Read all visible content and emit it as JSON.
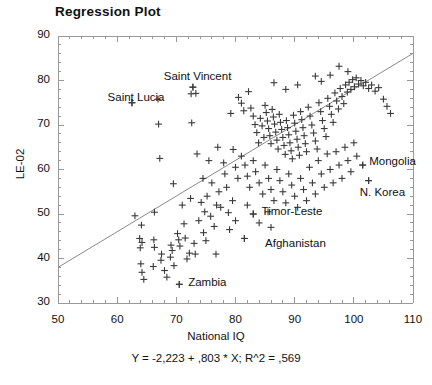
{
  "chart_data": {
    "type": "scatter",
    "title": "Regression Plot",
    "xlabel": "National IQ",
    "ylabel": "LE-02",
    "xlim": [
      50,
      110
    ],
    "ylim": [
      30,
      90
    ],
    "xticks": [
      "50",
      "60",
      "70",
      "80",
      "90",
      "100",
      "110"
    ],
    "yticks": [
      "90",
      "80",
      "70",
      "60",
      "50",
      "40",
      "30"
    ],
    "xtick_values": [
      50,
      60,
      70,
      80,
      90,
      100,
      110
    ],
    "ytick_values": [
      90,
      80,
      70,
      60,
      50,
      40,
      30
    ],
    "grid": false,
    "legend": "none",
    "equation": "Y = -2,223 + ,803 * X; R^2 = ,569",
    "regression": {
      "intercept": -2.223,
      "slope": 0.803,
      "r_squared": 0.569,
      "x_start": 50,
      "y_start": 38.0,
      "x_end": 110,
      "y_end": 86.1
    },
    "marker": "plus",
    "marker_color": "#3a3a3a",
    "line_color": "#8a8a8a",
    "axis_color": "#999999",
    "annotations": [
      {
        "label": "Saint Lucia",
        "x": 62.5,
        "y": 75.0,
        "text_x": 68.0,
        "text_y": 75.8,
        "anchor": "end"
      },
      {
        "label": "Saint Vincent",
        "x": 72.8,
        "y": 78.5,
        "text_x": 79.3,
        "text_y": 80.6,
        "anchor": "end"
      },
      {
        "label": "Mongolia",
        "x": 101.5,
        "y": 61.0,
        "text_x": 102.6,
        "text_y": 61.4,
        "anchor": "start"
      },
      {
        "label": "N. Korea",
        "x": 102.5,
        "y": 57.5,
        "text_x": 101.0,
        "text_y": 54.6,
        "anchor": "start"
      },
      {
        "label": "Timor-Leste",
        "x": 83.0,
        "y": 50.0,
        "text_x": 84.4,
        "text_y": 50.3,
        "anchor": "start"
      },
      {
        "label": "Afghanistan",
        "x": 81.5,
        "y": 44.5,
        "text_x": 85.0,
        "text_y": 43.0,
        "anchor": "start"
      },
      {
        "label": "Zambia",
        "x": 70.5,
        "y": 34.2,
        "text_x": 72.0,
        "text_y": 34.2,
        "anchor": "start"
      }
    ],
    "points": [
      [
        62.5,
        75.0
      ],
      [
        66.9,
        75.8
      ],
      [
        67.0,
        70.2
      ],
      [
        67.2,
        62.5
      ],
      [
        72.8,
        78.5
      ],
      [
        72.5,
        77.0
      ],
      [
        73.3,
        77.1
      ],
      [
        72.6,
        70.5
      ],
      [
        69.5,
        56.8
      ],
      [
        63.0,
        49.6
      ],
      [
        66.3,
        50.4
      ],
      [
        64.1,
        47.5
      ],
      [
        63.8,
        44.5
      ],
      [
        64.2,
        43.6
      ],
      [
        63.9,
        42.4
      ],
      [
        64.0,
        38.8
      ],
      [
        64.2,
        36.9
      ],
      [
        64.5,
        35.3
      ],
      [
        66.2,
        44.2
      ],
      [
        66.3,
        42.5
      ],
      [
        66.1,
        38.2
      ],
      [
        67.5,
        41.0
      ],
      [
        67.4,
        39.6
      ],
      [
        68.0,
        37.3
      ],
      [
        68.4,
        35.8
      ],
      [
        69.1,
        43.0
      ],
      [
        69.3,
        41.8
      ],
      [
        69.0,
        40.3
      ],
      [
        69.6,
        38.4
      ],
      [
        70.2,
        45.6
      ],
      [
        70.4,
        44.2
      ],
      [
        70.6,
        42.8
      ],
      [
        70.5,
        34.2
      ],
      [
        71.3,
        47.8
      ],
      [
        71.5,
        44.6
      ],
      [
        71.8,
        39.9
      ],
      [
        72.2,
        41.2
      ],
      [
        73.0,
        43.4
      ],
      [
        73.2,
        41.0
      ],
      [
        74.2,
        52.6
      ],
      [
        74.6,
        45.8
      ],
      [
        75.0,
        44.0
      ],
      [
        76.4,
        47.2
      ],
      [
        76.7,
        41.0
      ],
      [
        78.8,
        50.3
      ],
      [
        79.2,
        72.6
      ],
      [
        80.5,
        76.2
      ],
      [
        81.0,
        74.9
      ],
      [
        81.4,
        73.2
      ],
      [
        82.2,
        77.5
      ],
      [
        82.6,
        73.8
      ],
      [
        83.0,
        72.0
      ],
      [
        83.3,
        70.1
      ],
      [
        83.6,
        68.3
      ],
      [
        83.9,
        66.0
      ],
      [
        84.2,
        71.5
      ],
      [
        84.5,
        69.8
      ],
      [
        84.8,
        67.2
      ],
      [
        85.0,
        74.4
      ],
      [
        85.2,
        72.8
      ],
      [
        85.4,
        70.9
      ],
      [
        85.6,
        69.2
      ],
      [
        85.8,
        67.6
      ],
      [
        86.0,
        65.8
      ],
      [
        86.2,
        73.5
      ],
      [
        86.4,
        71.8
      ],
      [
        86.6,
        70.2
      ],
      [
        86.8,
        68.4
      ],
      [
        87.0,
        66.6
      ],
      [
        87.2,
        64.6
      ],
      [
        87.4,
        72.4
      ],
      [
        87.6,
        70.6
      ],
      [
        87.8,
        69.0
      ],
      [
        88.0,
        67.2
      ],
      [
        88.2,
        65.4
      ],
      [
        88.4,
        63.4
      ],
      [
        88.6,
        71.0
      ],
      [
        88.8,
        69.4
      ],
      [
        89.0,
        67.8
      ],
      [
        89.2,
        66.0
      ],
      [
        89.4,
        64.2
      ],
      [
        89.6,
        62.4
      ],
      [
        89.8,
        72.2
      ],
      [
        90.0,
        70.4
      ],
      [
        90.2,
        68.6
      ],
      [
        90.4,
        66.8
      ],
      [
        90.6,
        65.0
      ],
      [
        90.8,
        63.2
      ],
      [
        91.0,
        73.0
      ],
      [
        91.2,
        71.2
      ],
      [
        91.4,
        69.4
      ],
      [
        91.6,
        67.6
      ],
      [
        91.8,
        65.8
      ],
      [
        92.0,
        64.0
      ],
      [
        92.3,
        74.0
      ],
      [
        92.6,
        72.0
      ],
      [
        92.9,
        70.0
      ],
      [
        93.2,
        68.2
      ],
      [
        93.5,
        66.4
      ],
      [
        93.8,
        64.6
      ],
      [
        94.1,
        75.0
      ],
      [
        94.4,
        73.0
      ],
      [
        94.7,
        71.0
      ],
      [
        95.0,
        69.2
      ],
      [
        95.3,
        67.4
      ],
      [
        95.6,
        76.0
      ],
      [
        95.9,
        74.2
      ],
      [
        96.2,
        72.4
      ],
      [
        96.5,
        70.6
      ],
      [
        96.8,
        77.2
      ],
      [
        97.1,
        75.4
      ],
      [
        97.4,
        73.6
      ],
      [
        97.7,
        78.2
      ],
      [
        98.0,
        76.4
      ],
      [
        98.3,
        74.8
      ],
      [
        98.6,
        79.0
      ],
      [
        98.9,
        77.4
      ],
      [
        99.2,
        79.6
      ],
      [
        99.5,
        78.0
      ],
      [
        99.8,
        80.2
      ],
      [
        100.1,
        78.6
      ],
      [
        100.4,
        80.6
      ],
      [
        100.8,
        79.2
      ],
      [
        101.2,
        80.0
      ],
      [
        101.6,
        78.8
      ],
      [
        102.0,
        79.6
      ],
      [
        102.5,
        78.2
      ],
      [
        103.0,
        79.0
      ],
      [
        103.6,
        77.6
      ],
      [
        104.2,
        78.4
      ],
      [
        105.0,
        75.8
      ],
      [
        105.6,
        74.2
      ],
      [
        106.2,
        72.6
      ],
      [
        97.5,
        83.2
      ],
      [
        99.0,
        82.0
      ],
      [
        93.5,
        81.0
      ],
      [
        86.5,
        79.5
      ],
      [
        88.5,
        78.0
      ],
      [
        90.5,
        79.0
      ],
      [
        94.5,
        79.8
      ],
      [
        96.0,
        81.2
      ],
      [
        80.0,
        60.5
      ],
      [
        80.4,
        58.0
      ],
      [
        81.0,
        63.0
      ],
      [
        81.6,
        61.0
      ],
      [
        82.0,
        58.5
      ],
      [
        82.4,
        56.0
      ],
      [
        83.0,
        62.0
      ],
      [
        83.4,
        59.5
      ],
      [
        84.0,
        57.0
      ],
      [
        84.6,
        54.5
      ],
      [
        85.0,
        61.0
      ],
      [
        85.6,
        58.0
      ],
      [
        86.0,
        55.5
      ],
      [
        86.5,
        53.0
      ],
      [
        87.0,
        60.0
      ],
      [
        87.5,
        57.5
      ],
      [
        88.0,
        55.0
      ],
      [
        88.5,
        52.5
      ],
      [
        89.0,
        59.0
      ],
      [
        89.5,
        56.5
      ],
      [
        90.0,
        54.0
      ],
      [
        90.5,
        51.5
      ],
      [
        91.0,
        58.0
      ],
      [
        91.5,
        55.5
      ],
      [
        92.0,
        53.0
      ],
      [
        92.5,
        60.5
      ],
      [
        93.0,
        57.0
      ],
      [
        93.5,
        54.5
      ],
      [
        94.0,
        62.0
      ],
      [
        94.5,
        59.0
      ],
      [
        95.0,
        56.0
      ],
      [
        95.5,
        63.5
      ],
      [
        96.0,
        60.0
      ],
      [
        96.5,
        57.0
      ],
      [
        97.0,
        64.0
      ],
      [
        97.5,
        61.0
      ],
      [
        98.0,
        58.0
      ],
      [
        98.5,
        65.0
      ],
      [
        99.0,
        62.0
      ],
      [
        99.5,
        59.5
      ],
      [
        100.0,
        66.0
      ],
      [
        100.5,
        63.0
      ],
      [
        101.5,
        61.0
      ],
      [
        102.5,
        57.5
      ],
      [
        83.0,
        50.0
      ],
      [
        81.5,
        44.5
      ],
      [
        79.5,
        53.0
      ],
      [
        78.5,
        56.0
      ],
      [
        84.0,
        48.0
      ],
      [
        86.0,
        47.0
      ],
      [
        80.0,
        48.5
      ],
      [
        77.5,
        51.5
      ],
      [
        85.5,
        50.5
      ],
      [
        82.0,
        52.0
      ],
      [
        79.0,
        46.5
      ],
      [
        73.5,
        63.5
      ],
      [
        75.5,
        62.0
      ],
      [
        77.0,
        65.0
      ],
      [
        78.0,
        61.5
      ],
      [
        74.5,
        58.0
      ],
      [
        76.0,
        57.0
      ],
      [
        78.2,
        59.0
      ],
      [
        79.6,
        64.5
      ],
      [
        75.2,
        54.0
      ],
      [
        77.2,
        55.0
      ],
      [
        76.8,
        52.0
      ],
      [
        74.8,
        50.5
      ],
      [
        72.4,
        53.5
      ],
      [
        71.0,
        52.0
      ],
      [
        73.8,
        48.5
      ],
      [
        75.8,
        49.5
      ]
    ]
  }
}
